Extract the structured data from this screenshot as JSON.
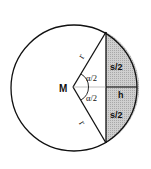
{
  "diagram": {
    "labels": {
      "center": "M",
      "radius_top": "r",
      "radius_bottom": "r",
      "angle_top": "α/2",
      "angle_bottom": "α/2",
      "half_chord_top": "s/2",
      "half_chord_bottom": "s/2",
      "height": "h"
    },
    "colors": {
      "stroke": "#111111",
      "segment_fill": "#c8c8c8",
      "background": "#ffffff"
    }
  }
}
